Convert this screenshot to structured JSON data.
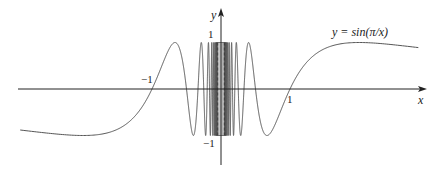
{
  "chart_data": {
    "type": "line",
    "title": "",
    "function": "y = sin(pi/x)",
    "equation_label": "y = sin(π/x)",
    "xlabel": "x",
    "ylabel": "y",
    "x_tick_labels": [
      {
        "value": -1,
        "label": "−1"
      },
      {
        "value": 1,
        "label": "1"
      }
    ],
    "y_tick_labels": [
      {
        "value": 1,
        "label": "1"
      },
      {
        "value": -1,
        "label": "−1"
      }
    ],
    "xlim": [
      -2.91,
      2.86
    ],
    "ylim": [
      -1,
      1
    ],
    "grid": false,
    "legend": "none",
    "series": [
      {
        "name": "y = sin(π/x)",
        "samples": [
          {
            "x": -2.9,
            "y": -0.88
          },
          {
            "x": -2.0,
            "y": -1.0
          },
          {
            "x": -1.0,
            "y": 0.0
          },
          {
            "x": -0.667,
            "y": 1.0
          },
          {
            "x": -0.5,
            "y": 0.0
          },
          {
            "x": -0.4,
            "y": -1.0
          },
          {
            "x": -0.333,
            "y": 0.0
          },
          {
            "x": 0.333,
            "y": 0.0
          },
          {
            "x": 0.4,
            "y": 1.0
          },
          {
            "x": 0.5,
            "y": 0.0
          },
          {
            "x": 0.667,
            "y": -1.0
          },
          {
            "x": 1.0,
            "y": 0.0
          },
          {
            "x": 2.0,
            "y": 1.0
          },
          {
            "x": 2.86,
            "y": 0.89
          }
        ],
        "note": "oscillates infinitely often between -1 and 1 as x approaches 0; dashed vertical lines at x≈±0.05 bound the dense region"
      }
    ]
  },
  "plot": {
    "origin_px": [
      221,
      89
    ],
    "x_scale_px": 69,
    "y_scale_px": 46.5,
    "x_axis_px": [
      18,
      427
    ],
    "y_axis_px": [
      165,
      8
    ],
    "curve_color": "#555555",
    "axis_color": "#222222"
  },
  "labels": {
    "x_axis": "x",
    "y_axis": "y",
    "equation": "y = sin(π/x)",
    "tick_x_neg1": "−1",
    "tick_x_pos1": "1",
    "tick_y_pos1": "1",
    "tick_y_neg1": "−1"
  }
}
